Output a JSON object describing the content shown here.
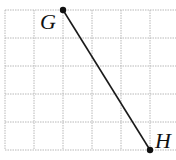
{
  "diagram": {
    "type": "grid-segment",
    "grid": {
      "columns": 5,
      "rows": 5,
      "line_color": "#b8b8b8",
      "x_lines": [
        5,
        34,
        63,
        92,
        121,
        150
      ],
      "y_lines": [
        10,
        38,
        66,
        94,
        122,
        150
      ],
      "right_extent": 176
    },
    "points": [
      {
        "name": "G",
        "label": "G",
        "grid_col": 2,
        "grid_row": 0,
        "x": 63,
        "y": 10,
        "label_x": 40,
        "label_y": 29
      },
      {
        "name": "H",
        "label": "H",
        "grid_col": 5,
        "grid_row": 5,
        "x": 150,
        "y": 150,
        "label_x": 155,
        "label_y": 148
      }
    ],
    "segment": {
      "from": "G",
      "to": "H",
      "color": "#1a1a1a"
    }
  }
}
